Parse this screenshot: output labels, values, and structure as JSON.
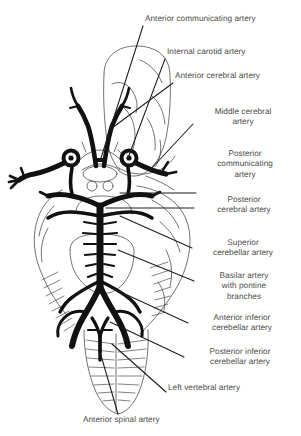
{
  "figure": {
    "view": "inferior / ventral view of brain with cerebellum and brainstem",
    "ink_color": "#1a1a1a",
    "text_color": "#4a4a4a",
    "background_color": "#ffffff"
  },
  "labels": [
    {
      "id": "anterior-communicating-artery",
      "text": "Anterior communicating artery",
      "align": "left",
      "x": 145,
      "y": 19,
      "width": 152
    },
    {
      "id": "internal-carotid-artery",
      "text": "Internal carotid artery",
      "align": "left",
      "x": 167,
      "y": 52,
      "width": 130
    },
    {
      "id": "anterior-cerebral-artery",
      "text": "Anterior cerebral artery",
      "align": "left",
      "x": 175,
      "y": 76,
      "width": 122
    },
    {
      "id": "middle-cerebral-artery",
      "text": "Middle cerebral\nartery",
      "align": "center",
      "x": 195,
      "y": 112,
      "width": 96
    },
    {
      "id": "posterior-communicating-artery",
      "text": "Posterior\ncommunicating\nartery",
      "align": "center",
      "x": 198,
      "y": 154,
      "width": 94
    },
    {
      "id": "posterior-cerebral-artery",
      "text": "Posterior\ncerebral artery",
      "align": "center",
      "x": 196,
      "y": 200,
      "width": 96
    },
    {
      "id": "superior-cerebellar-artery",
      "text": "Superior\ncerebellar artery",
      "align": "center",
      "x": 194,
      "y": 243,
      "width": 98
    },
    {
      "id": "basilar-artery",
      "text": "Basilar artery\nwith pontine\nbranches",
      "align": "center",
      "x": 196,
      "y": 276,
      "width": 96
    },
    {
      "id": "anterior-inferior-cerebellar-artery",
      "text": "Anterior inferior\ncerebellar artery",
      "align": "center",
      "x": 190,
      "y": 318,
      "width": 104
    },
    {
      "id": "posterior-inferior-cerebellar-artery",
      "text": "Posterior inferior\ncerebellar artery",
      "align": "center",
      "x": 186,
      "y": 352,
      "width": 108
    },
    {
      "id": "left-vertebral-artery",
      "text": "Left vertebral artery",
      "align": "left",
      "x": 168,
      "y": 388,
      "width": 126
    },
    {
      "id": "anterior-spinal-artery",
      "text": "Anterior spinal artery",
      "align": "left",
      "x": 83,
      "y": 420,
      "width": 126
    }
  ]
}
